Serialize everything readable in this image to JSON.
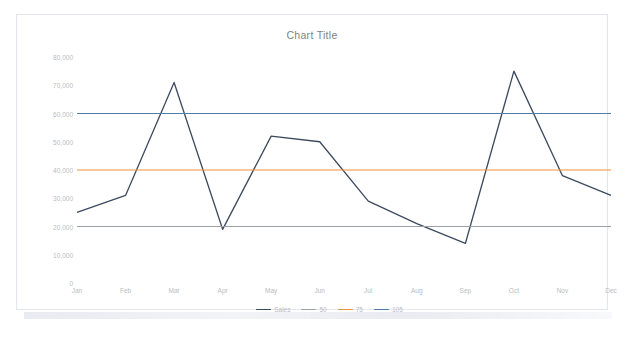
{
  "chart": {
    "title": "Chart Title",
    "plot_background": "#ffffff",
    "frame_border_color": "#e3e6ea"
  },
  "chart_data": {
    "type": "line",
    "title": "Chart Title",
    "xlabel": "",
    "ylabel": "",
    "grid": false,
    "legend_position": "bottom",
    "categories": [
      "Jan",
      "Feb",
      "Mar",
      "Apr",
      "May",
      "Jun",
      "Jul",
      "Aug",
      "Sep",
      "Oct",
      "Nov",
      "Dec"
    ],
    "ylim": [
      0,
      80000
    ],
    "yticks": [
      0,
      10000,
      20000,
      30000,
      40000,
      50000,
      60000,
      70000,
      80000
    ],
    "ytick_labels": [
      "0",
      "10,000",
      "20,000",
      "30,000",
      "40,000",
      "50,000",
      "60,000",
      "70,000",
      "80,000"
    ],
    "series": [
      {
        "name": "Sales",
        "color": "#3b4a5f",
        "type": "line",
        "values": [
          25000,
          31000,
          71000,
          19000,
          52000,
          50000,
          29000,
          21000,
          14000,
          75000,
          38000,
          31000
        ]
      },
      {
        "name": "50",
        "color": "#9aa0a6",
        "type": "reference-line",
        "value": 20000,
        "values": [
          20000,
          20000,
          20000,
          20000,
          20000,
          20000,
          20000,
          20000,
          20000,
          20000,
          20000,
          20000
        ]
      },
      {
        "name": "75",
        "color": "#ed9240",
        "type": "reference-line",
        "value": 40000,
        "values": [
          40000,
          40000,
          40000,
          40000,
          40000,
          40000,
          40000,
          40000,
          40000,
          40000,
          40000,
          40000
        ]
      },
      {
        "name": "105",
        "color": "#4f7fa8",
        "type": "reference-line",
        "value": 60000,
        "values": [
          60000,
          60000,
          60000,
          60000,
          60000,
          60000,
          60000,
          60000,
          60000,
          60000,
          60000,
          60000
        ]
      }
    ]
  }
}
